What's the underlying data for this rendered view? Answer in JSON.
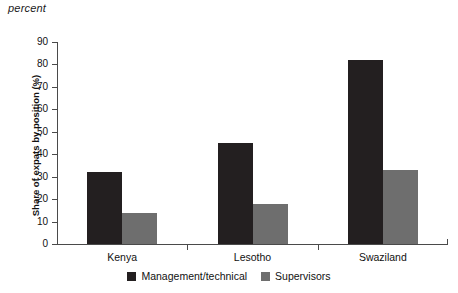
{
  "unit_label": "percent",
  "chart_data": {
    "type": "bar",
    "title": "",
    "subtitle": "",
    "xlabel": "",
    "ylabel": "Share of expats by position (%)",
    "unit_note": "percent",
    "categories": [
      "Kenya",
      "Lesotho",
      "Swaziland"
    ],
    "series": [
      {
        "name": "Management/technical",
        "color": "#231f20",
        "values": [
          32,
          45,
          82
        ]
      },
      {
        "name": "Supervisors",
        "color": "#6e6e6e",
        "values": [
          14,
          18,
          33
        ]
      }
    ],
    "ylim": [
      0,
      90
    ],
    "ytick_step": 10,
    "yticks": [
      0,
      10,
      20,
      30,
      40,
      50,
      60,
      70,
      80,
      90
    ],
    "ytick_labels": [
      "0",
      "10",
      "20",
      "30",
      "40",
      "50",
      "60",
      "70",
      "80",
      "90"
    ],
    "grid": false,
    "legend_position": "bottom-center"
  }
}
